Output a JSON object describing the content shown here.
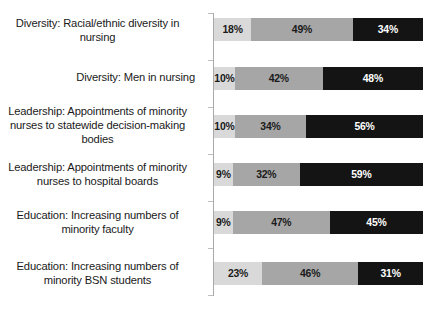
{
  "chart_data": {
    "type": "bar",
    "orientation": "horizontal",
    "stacked": true,
    "stack_mode": "percent",
    "title": "",
    "subtitle": "",
    "xlabel": "",
    "ylabel": "",
    "xlim": [
      0,
      100
    ],
    "grid": false,
    "legend": "none",
    "axis_line": "category axis only, vertical, left of bars",
    "categories": [
      "Diversity: Racial/ethnic diversity in nursing",
      "Diversity: Men in nursing",
      "Leadership: Appointments of minority nurses to statewide decision-making bodies",
      "Leadership: Appointments of minority nurses to hospital boards",
      "Education: Increasing numbers of minority faculty",
      "Education: Increasing numbers of minority BSN students"
    ],
    "category_label_lines": [
      [
        "Diversity: Racial/ethnic diversity in",
        "nursing"
      ],
      [
        "Diversity: Men in nursing"
      ],
      [
        "Leadership: Appointments of minority",
        "nurses to statewide decision-making",
        "bodies"
      ],
      [
        "Leadership: Appointments of minority",
        "nurses to hospital boards"
      ],
      [
        "Education: Increasing numbers of",
        "minority faculty"
      ],
      [
        "Education: Increasing numbers of",
        "minority BSN students"
      ]
    ],
    "series": [
      {
        "name": "segment-1",
        "color": "#d9d9d9",
        "values": [
          18,
          10,
          10,
          9,
          9,
          23
        ]
      },
      {
        "name": "segment-2",
        "color": "#a6a6a6",
        "values": [
          49,
          42,
          34,
          32,
          47,
          46
        ]
      },
      {
        "name": "segment-3",
        "color": "#141414",
        "values": [
          34,
          48,
          56,
          59,
          45,
          31
        ]
      }
    ],
    "data_labels": [
      [
        "18%",
        "49%",
        "34%"
      ],
      [
        "10%",
        "42%",
        "48%"
      ],
      [
        "10%",
        "34%",
        "56%"
      ],
      [
        "9%",
        "32%",
        "59%"
      ],
      [
        "9%",
        "47%",
        "45%"
      ],
      [
        "23%",
        "46%",
        "31%"
      ]
    ]
  },
  "colors": {
    "background": "#ffffff",
    "axis_line": "#a8a8a8",
    "segment_light": "#d9d9d9",
    "segment_mid": "#a6a6a6",
    "segment_dark": "#141414",
    "label_text": "#1a1a1a",
    "dark_segment_text": "#ffffff"
  },
  "rows": [
    {
      "label": "Diversity: Racial/ethnic diversity in\nnursing",
      "label_align": "center",
      "label_top": 16,
      "bar_top": 18,
      "segments": [
        {
          "value": 18,
          "text": "18%",
          "style": "seg-light"
        },
        {
          "value": 49,
          "text": "49%",
          "style": "seg-mid"
        },
        {
          "value": 34,
          "text": "34%",
          "style": "seg-dark"
        }
      ]
    },
    {
      "label": "Diversity: Men in nursing",
      "label_align": "right",
      "label_top": 70,
      "bar_top": 67,
      "segments": [
        {
          "value": 10,
          "text": "10%",
          "style": "seg-light"
        },
        {
          "value": 42,
          "text": "42%",
          "style": "seg-mid"
        },
        {
          "value": 48,
          "text": "48%",
          "style": "seg-dark"
        }
      ]
    },
    {
      "label": "Leadership: Appointments of minority\nnurses to statewide decision-making\nbodies",
      "label_align": "center",
      "label_top": 104,
      "bar_top": 115,
      "segments": [
        {
          "value": 10,
          "text": "10%",
          "style": "seg-light"
        },
        {
          "value": 34,
          "text": "34%",
          "style": "seg-mid"
        },
        {
          "value": 56,
          "text": "56%",
          "style": "seg-dark"
        }
      ]
    },
    {
      "label": "Leadership: Appointments of minority\nnurses to hospital boards",
      "label_align": "center",
      "label_top": 160,
      "bar_top": 163,
      "segments": [
        {
          "value": 9,
          "text": "9%",
          "style": "seg-light"
        },
        {
          "value": 32,
          "text": "32%",
          "style": "seg-mid"
        },
        {
          "value": 59,
          "text": "59%",
          "style": "seg-dark"
        }
      ]
    },
    {
      "label": "Education: Increasing numbers of\nminority faculty",
      "label_align": "center",
      "label_top": 208,
      "bar_top": 211,
      "segments": [
        {
          "value": 9,
          "text": "9%",
          "style": "seg-light"
        },
        {
          "value": 47,
          "text": "47%",
          "style": "seg-mid"
        },
        {
          "value": 45,
          "text": "45%",
          "style": "seg-dark"
        }
      ]
    },
    {
      "label": "Education: Increasing numbers of\nminority BSN students",
      "label_align": "center",
      "label_top": 259,
      "bar_top": 262,
      "segments": [
        {
          "value": 23,
          "text": "23%",
          "style": "seg-light"
        },
        {
          "value": 46,
          "text": "46%",
          "style": "seg-mid"
        },
        {
          "value": 31,
          "text": "31%",
          "style": "seg-dark"
        }
      ]
    }
  ],
  "axis": {
    "tick_positions": [
      13,
      60,
      107,
      154,
      201,
      248,
      295
    ]
  }
}
